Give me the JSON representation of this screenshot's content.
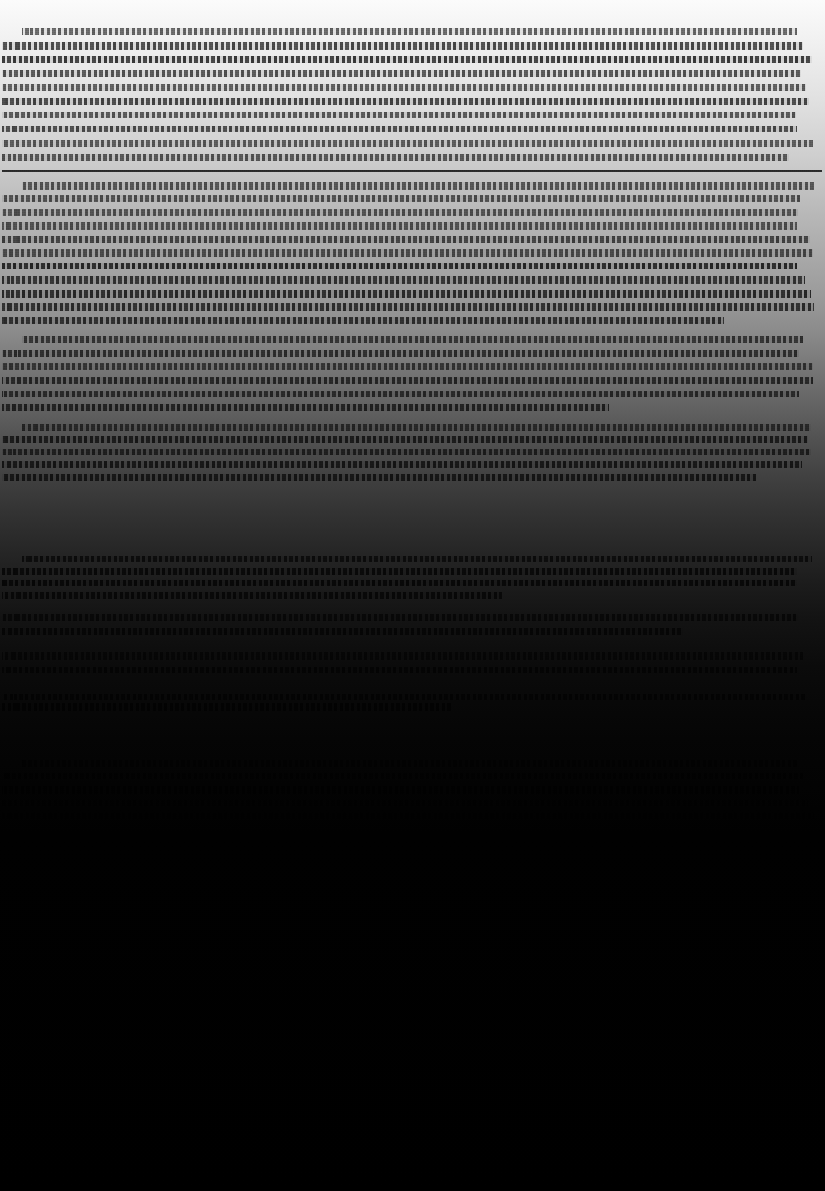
{
  "document": {
    "kind": "scanned-document-page",
    "legibility": "illegible",
    "recovered_text": "",
    "note_visible_on_page": "",
    "width_px": 825,
    "height_px": 1191
  },
  "canvas": {
    "background_color": "#000000",
    "paper_color": "#ffffff",
    "ink_color": "#191919"
  },
  "exposure_gradient": {
    "direction": "top-to-bottom",
    "description": "page fades from near-white at top to pure black",
    "stops": [
      {
        "position_pct": 0,
        "color": "#fbfbfb"
      },
      {
        "position_pct": 3,
        "color": "#f2f2f2"
      },
      {
        "position_pct": 8,
        "color": "#e2e2e2"
      },
      {
        "position_pct": 13,
        "color": "#cfcfcf"
      },
      {
        "position_pct": 17,
        "color": "#bcbcbc"
      },
      {
        "position_pct": 21,
        "color": "#ababab"
      },
      {
        "position_pct": 25,
        "color": "#9a9a9a"
      },
      {
        "position_pct": 28,
        "color": "#8a8a8a"
      },
      {
        "position_pct": 31,
        "color": "#767676"
      },
      {
        "position_pct": 34,
        "color": "#636363"
      },
      {
        "position_pct": 37,
        "color": "#515151"
      },
      {
        "position_pct": 40,
        "color": "#414141"
      },
      {
        "position_pct": 43,
        "color": "#333333"
      },
      {
        "position_pct": 46,
        "color": "#272727"
      },
      {
        "position_pct": 49,
        "color": "#1c1c1c"
      },
      {
        "position_pct": 52,
        "color": "#131313"
      },
      {
        "position_pct": 56,
        "color": "#0b0b0b"
      },
      {
        "position_pct": 62,
        "color": "#050505"
      },
      {
        "position_pct": 70,
        "color": "#010101"
      },
      {
        "position_pct": 100,
        "color": "#000000"
      }
    ]
  },
  "layout": {
    "text_left_px": 2,
    "text_right_px": 822,
    "content_top_px": 28,
    "content_bottom_px": 826,
    "empty_region_top_px": 826,
    "line_pitch_px": 13.5,
    "justification": "justified"
  },
  "divider_rules": [
    {
      "y_px": 170,
      "left_px": 2,
      "width_px": 820
    }
  ],
  "paragraph_blocks": [
    {
      "id": "block-1",
      "top_px": 28,
      "bottom_px": 168,
      "line_count": 10,
      "last_line_width_pct": 96
    },
    {
      "id": "block-2",
      "top_px": 182,
      "bottom_px": 330,
      "line_count": 11,
      "last_line_width_pct": 88
    },
    {
      "id": "block-3",
      "top_px": 336,
      "bottom_px": 418,
      "line_count": 6,
      "last_line_width_pct": 74
    },
    {
      "id": "block-4",
      "top_px": 424,
      "bottom_px": 486,
      "line_count": 5,
      "last_line_width_pct": 92
    },
    {
      "id": "block-5",
      "top_px": 556,
      "bottom_px": 604,
      "line_count": 4,
      "last_line_width_pct": 61
    },
    {
      "id": "block-6",
      "top_px": 614,
      "bottom_px": 642,
      "line_count": 2,
      "last_line_width_pct": 83
    },
    {
      "id": "block-7",
      "top_px": 652,
      "bottom_px": 682,
      "line_count": 2,
      "last_line_width_pct": 97
    },
    {
      "id": "block-8",
      "top_px": 694,
      "bottom_px": 712,
      "line_count": 2,
      "last_line_width_pct": 55
    },
    {
      "id": "block-9",
      "top_px": 760,
      "bottom_px": 826,
      "line_count": 5,
      "last_line_width_pct": 99
    }
  ]
}
